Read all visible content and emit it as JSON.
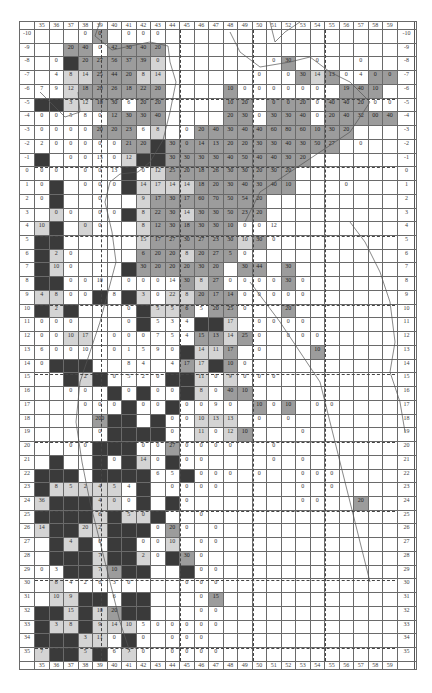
{
  "map": {
    "columns": [
      35,
      36,
      37,
      38,
      39,
      40,
      41,
      42,
      43,
      44,
      45,
      46,
      47,
      48,
      49,
      50,
      51,
      52,
      53,
      54,
      55,
      56,
      57,
      58,
      59
    ],
    "row_labels": [
      "-10",
      "-9",
      "-8",
      "-7",
      "-6",
      "-5",
      "-4",
      "-3",
      "-2",
      "-1",
      "0",
      "1",
      "2",
      "3",
      "4",
      "5",
      "6",
      "7",
      "8",
      "9",
      "10",
      "11",
      "12",
      "13",
      "14",
      "15",
      "16",
      "17",
      "18",
      "19",
      "20",
      "21",
      "22",
      "23",
      "24",
      "25",
      "26",
      "27",
      "28",
      "29",
      "30",
      "31",
      "32",
      "33",
      "34",
      "35"
    ],
    "dashed_columns_after": [
      39,
      44,
      49,
      54
    ],
    "dashed_rows_before": [
      "-5",
      "0",
      "5",
      "10",
      "15",
      "20",
      "25",
      "30",
      "35"
    ],
    "shade_legend": {
      "w": "#ffffff",
      "l": "#d4d4d4",
      "m": "#9c9c9c",
      "d": "#3a3a3a"
    },
    "rows": [
      [
        "w",
        "w",
        "w",
        "w:0",
        "m:0",
        "w",
        "w:0",
        "w:0",
        "w:0",
        "w",
        "w",
        "w",
        "w",
        "w",
        "w",
        "w",
        "w",
        "w",
        "w",
        "w",
        "w",
        "w",
        "w",
        "w",
        "w"
      ],
      [
        "w",
        "w",
        "m:20",
        "m:40",
        "w:0",
        "m:42",
        "m:30",
        "m:40",
        "m:20",
        "w",
        "w",
        "w",
        "w",
        "w",
        "w",
        "w",
        "w",
        "w",
        "w",
        "w",
        "w",
        "w",
        "w",
        "w",
        "w"
      ],
      [
        "w",
        "w:0",
        "d",
        "m:20",
        "m:27",
        "m:56",
        "m:37",
        "m:39",
        "l:0",
        "w",
        "w",
        "w",
        "w",
        "w",
        "w",
        "w",
        "w:0",
        "m:30",
        "w",
        "w:0",
        "w",
        "w",
        "w:0",
        "w",
        "w"
      ],
      [
        "w",
        "w:4",
        "l:8",
        "l:14",
        "m:25",
        "m:44",
        "m:20",
        "l:8",
        "l:14",
        "w",
        "w",
        "w",
        "w",
        "w",
        "w",
        "w:0",
        "w",
        "w:0",
        "m:30",
        "l:14",
        "m:13",
        "w:0",
        "w:4",
        "m:0",
        "m:0"
      ],
      [
        "w:7",
        "w:9",
        "l:12",
        "m:18",
        "m:20",
        "m:26",
        "m:18",
        "m:22",
        "m:20",
        "w",
        "w",
        "w",
        "w",
        "m:10",
        "w:0",
        "w:0",
        "w:0",
        "w:0",
        "w:0",
        "w:0",
        "w",
        "m:19",
        "m:40",
        "m:10",
        "w"
      ],
      [
        "d",
        "d",
        "l:3",
        "l:12",
        "m:10",
        "m:30",
        "w:6",
        "m:20",
        "m:20",
        "w",
        "w",
        "w",
        "w",
        "m:10",
        "m:20",
        "w",
        "m:0",
        "m:0",
        "m:20",
        "w:0",
        "m:40",
        "m:40",
        "m:20",
        "w:0",
        "w:0"
      ],
      [
        "w:0",
        "w:0",
        "w:5",
        "w:8",
        "w:0",
        "m:12",
        "m:30",
        "m:30",
        "m:40",
        "w",
        "w",
        "w",
        "w",
        "m:20",
        "m:30",
        "w:0",
        "m:30",
        "m:30",
        "m:40",
        "w:0",
        "m:20",
        "m:40",
        "m:32",
        "m:00",
        "m:40"
      ],
      [
        "w:0",
        "w:0",
        "w:0",
        "w:0",
        "m:20",
        "m:20",
        "m:23",
        "w:6",
        "l:8",
        "w",
        "w:0",
        "m:20",
        "m:40",
        "m:30",
        "m:40",
        "m:40",
        "m:60",
        "m:80",
        "m:60",
        "m:10",
        "m:30",
        "m:20",
        "w",
        "w",
        "w"
      ],
      [
        "w:2",
        "w:0",
        "w:0",
        "w:0",
        "w:0",
        "w:0",
        "m:21",
        "m:20",
        "d",
        "m:30",
        "m:0",
        "m:14",
        "m:13",
        "m:20",
        "m:20",
        "m:30",
        "m:30",
        "m:40",
        "m:30",
        "m:50",
        "m:27",
        "w",
        "w:0",
        "w",
        "w"
      ],
      [
        "d",
        "w",
        "w:0",
        "w:0",
        "w:15",
        "w:0",
        "l:12",
        "d",
        "d",
        "m:30",
        "m:30",
        "m:30",
        "m:30",
        "m:40",
        "m:50",
        "m:40",
        "m:40",
        "m:30",
        "m:20",
        "w",
        "w",
        "w",
        "w",
        "w",
        "w"
      ],
      [
        "w:0",
        "w:0",
        "w",
        "w:0",
        "w:0",
        "w:13",
        "d",
        "w:0",
        "l:12",
        "m:25",
        "m:20",
        "m:18",
        "m:26",
        "m:30",
        "m:30",
        "m:20",
        "m:30",
        "m:20",
        "w",
        "w",
        "w",
        "w",
        "w",
        "w",
        "w"
      ],
      [
        "w:0",
        "d",
        "w",
        "w:0",
        "w:0",
        "w:0",
        "d",
        "l:14",
        "l:17",
        "l:14",
        "l:14",
        "m:18",
        "m:20",
        "m:30",
        "m:40",
        "m:30",
        "m:40",
        "m:10",
        "w",
        "w",
        "w",
        "w:0",
        "w",
        "w",
        "w"
      ],
      [
        "w:0",
        "d",
        "w",
        "w",
        "w:0",
        "w",
        "w",
        "l:9",
        "m:17",
        "m:30",
        "m:17",
        "m:60",
        "m:70",
        "m:50",
        "m:54",
        "m:20",
        "w",
        "w",
        "w",
        "w",
        "w",
        "w",
        "w",
        "w",
        "w"
      ],
      [
        "w",
        "l:0",
        "w:0",
        "w",
        "w:0",
        "w:0",
        "d",
        "l:8",
        "m:22",
        "m:30",
        "l:14",
        "m:30",
        "m:30",
        "m:50",
        "m:23",
        "m:20",
        "w",
        "w",
        "w",
        "w",
        "w",
        "w",
        "w",
        "w",
        "w"
      ],
      [
        "l:10",
        "d",
        "w",
        "l:0",
        "w:0",
        "w",
        "w",
        "l:8",
        "m:12",
        "m:30",
        "m:18",
        "m:30",
        "m:30",
        "m:10",
        "w:0",
        "w:0",
        "w:12",
        "w",
        "w",
        "w",
        "w",
        "w",
        "w",
        "w",
        "w"
      ],
      [
        "d",
        "d",
        "w",
        "w",
        "w",
        "w",
        "w",
        "l:15",
        "m:17",
        "m:27",
        "m:30",
        "m:27",
        "m:23",
        "m:30",
        "l:10",
        "m:30",
        "w:0",
        "w",
        "w",
        "w",
        "w",
        "w",
        "w",
        "w",
        "w"
      ],
      [
        "d",
        "l:2",
        "w:0",
        "w",
        "w",
        "w",
        "w",
        "m:6",
        "m:20",
        "m:20",
        "l:8",
        "m:20",
        "m:27",
        "m:5",
        "w:0",
        "w",
        "w",
        "w",
        "w",
        "w",
        "w",
        "w",
        "w",
        "w",
        "w"
      ],
      [
        "d",
        "l:10",
        "w:0",
        "w",
        "w",
        "w",
        "d",
        "m:30",
        "m:20",
        "m:20",
        "m:20",
        "m:30",
        "m:20",
        "w",
        "m:30",
        "m:44",
        "w",
        "m:30",
        "w",
        "w",
        "w",
        "w",
        "w",
        "w",
        "w"
      ],
      [
        "d",
        "d",
        "w:0",
        "w:0",
        "w:10",
        "w",
        "w:0",
        "w:0",
        "w:0",
        "w:14",
        "m:30",
        "l:8",
        "m:27",
        "w:0",
        "w:0",
        "w:0",
        "w:0",
        "m:30",
        "w:0",
        "w",
        "w",
        "w",
        "w",
        "w",
        "w"
      ],
      [
        "l:4",
        "l:8",
        "w:0",
        "w:0",
        "d",
        "w:8",
        "d",
        "l:3",
        "w:0",
        "l:22",
        "l:8",
        "m:20",
        "m:17",
        "m:14",
        "w:0",
        "w:0",
        "w:0",
        "w:0",
        "w:0",
        "w",
        "w",
        "w",
        "w",
        "w",
        "w"
      ],
      [
        "d",
        "l:2",
        "d",
        "w",
        "w",
        "w",
        "w:0",
        "d",
        "l:5",
        "l:5",
        "m:6",
        "w:5",
        "m:20",
        "m:25",
        "w:0",
        "w",
        "w",
        "m:20",
        "w",
        "w",
        "w",
        "w",
        "w",
        "w",
        "w"
      ],
      [
        "w:0",
        "w:0",
        "w:0",
        "w",
        "w",
        "w",
        "w:0",
        "d",
        "w:5",
        "w:3",
        "w:4",
        "d",
        "d",
        "l:17",
        "w",
        "w:0",
        "w:0",
        "w:0",
        "w:0",
        "w",
        "w",
        "w",
        "w",
        "w",
        "w"
      ],
      [
        "w:0",
        "w:0",
        "l:10",
        "l:17",
        "w",
        "w:0",
        "w:0",
        "w:0",
        "w:7",
        "w:5",
        "w:4",
        "m:15",
        "m:13",
        "l:14",
        "m:25",
        "w:0",
        "w",
        "w:0",
        "w:0",
        "w:0",
        "w",
        "w",
        "w",
        "w",
        "w"
      ],
      [
        "w:6",
        "w:0",
        "w:0",
        "w:10",
        "w",
        "w:0",
        "w:1",
        "w:5",
        "w:9",
        "w:0",
        "d",
        "l:14",
        "l:11",
        "m:17",
        "w",
        "w:0",
        "w",
        "w",
        "w",
        "m:10",
        "w",
        "w",
        "w",
        "w",
        "w"
      ],
      [
        "w:0",
        "d",
        "d",
        "d",
        "w",
        "w",
        "w:8",
        "w:4",
        "w",
        "w:4",
        "m:17",
        "l:17",
        "d",
        "m:10",
        "w:0",
        "w",
        "w",
        "w",
        "w",
        "w",
        "w",
        "w",
        "w",
        "w",
        "w"
      ],
      [
        "w",
        "w",
        "d",
        "l:2",
        "d",
        "w:0",
        "w:5",
        "w:2",
        "w:0",
        "d",
        "d",
        "l:11",
        "w:0",
        "l:9",
        "w:0",
        "w:0",
        "w:0",
        "w",
        "w",
        "w",
        "w",
        "w",
        "w",
        "w",
        "w"
      ],
      [
        "w",
        "w",
        "w:0",
        "w:0",
        "w",
        "d",
        "w:0",
        "d",
        "w:0",
        "w:0",
        "d",
        "l:8",
        "w:0",
        "m:40",
        "m:10",
        "w",
        "w",
        "w",
        "w",
        "w",
        "w",
        "w",
        "w",
        "w",
        "w"
      ],
      [
        "w",
        "w",
        "w",
        "w:0",
        "w:0",
        "w:0",
        "d",
        "w:0",
        "w:0",
        "d",
        "w:0",
        "w:0",
        "w:9",
        "w:0",
        "w",
        "m:10",
        "w:0",
        "m:10",
        "w",
        "w:0",
        "w:0",
        "w",
        "w",
        "w",
        "w"
      ],
      [
        "w",
        "w",
        "w",
        "w",
        "m:200",
        "d",
        "d",
        "w",
        "d",
        "w:0",
        "w:0",
        "l:10",
        "l:13",
        "l:13",
        "w",
        "w:0",
        "w",
        "w:0",
        "w",
        "w",
        "w",
        "w",
        "w",
        "w",
        "w"
      ],
      [
        "w",
        "w",
        "w",
        "w",
        "w:0",
        "d",
        "d",
        "d",
        "d",
        "w:0",
        "w",
        "l:11",
        "w:0",
        "l:12",
        "m:10",
        "w",
        "w",
        "w",
        "w:0",
        "w",
        "w",
        "w",
        "w",
        "w",
        "w"
      ],
      [
        "w",
        "w",
        "w:0",
        "w:0",
        "d",
        "d",
        "d",
        "w:0",
        "w:0",
        "m:27",
        "w:0",
        "w:0",
        "w:0",
        "w:0",
        "w",
        "w",
        "w:0",
        "w",
        "w",
        "w",
        "w",
        "w",
        "w",
        "w",
        "w"
      ],
      [
        "w",
        "d",
        "w",
        "w",
        "d",
        "w:0",
        "d",
        "l:14",
        "w:0",
        "d",
        "w:0",
        "w:0",
        "w",
        "w",
        "w",
        "w",
        "w:0",
        "w",
        "w:0",
        "w",
        "w",
        "w",
        "w",
        "w",
        "w"
      ],
      [
        "d",
        "d",
        "d",
        "w",
        "d",
        "d",
        "d",
        "d",
        "w:6",
        "w:5",
        "d",
        "w:0",
        "w:0",
        "w:0",
        "w",
        "w:0",
        "w",
        "w",
        "w:0",
        "w:0",
        "w:0",
        "w",
        "w",
        "w",
        "w"
      ],
      [
        "d",
        "l:8",
        "l:5",
        "l:2",
        "l:4",
        "l:5",
        "w:4",
        "d",
        "w",
        "w:0",
        "w:0",
        "w:0",
        "w:0",
        "w",
        "w",
        "w",
        "w",
        "w",
        "w:0",
        "w",
        "w:0",
        "w",
        "w",
        "w",
        "w"
      ],
      [
        "l:36",
        "d",
        "d",
        "d",
        "l:4",
        "l:0",
        "w:0",
        "d",
        "w",
        "d",
        "w:0",
        "w",
        "w",
        "w",
        "w",
        "w",
        "w",
        "w",
        "w:0",
        "w:0",
        "w",
        "w",
        "m:20",
        "w",
        "w"
      ],
      [
        "d",
        "d",
        "d",
        "d",
        "l:6",
        "d",
        "l:5",
        "l:0",
        "d",
        "w",
        "w",
        "w:0",
        "w",
        "w",
        "w",
        "w",
        "w",
        "w",
        "w",
        "w",
        "w",
        "w",
        "w",
        "w",
        "w"
      ],
      [
        "l:14",
        "d",
        "d",
        "l:20",
        "l:2",
        "d",
        "d",
        "d",
        "w:0",
        "m:20",
        "w:0",
        "w",
        "w:0",
        "w",
        "w",
        "w",
        "w",
        "w",
        "w",
        "w",
        "w",
        "w",
        "w",
        "w",
        "w"
      ],
      [
        "w",
        "d",
        "l:4",
        "d",
        "w:0",
        "d",
        "d",
        "w:0",
        "w:0",
        "l:10",
        "w",
        "w:0",
        "w:0",
        "w",
        "w",
        "w",
        "w",
        "w",
        "w",
        "w",
        "w",
        "w",
        "w",
        "w",
        "w"
      ],
      [
        "w",
        "d",
        "d",
        "d",
        "l:7",
        "d",
        "d",
        "l:2",
        "w:0",
        "d",
        "m:30",
        "w:0",
        "w",
        "w",
        "w",
        "w",
        "w",
        "w",
        "w",
        "w",
        "w",
        "w",
        "w",
        "w",
        "w"
      ],
      [
        "w:0",
        "w:3",
        "d",
        "d",
        "l:7",
        "m:10",
        "d",
        "d",
        "w",
        "w",
        "d",
        "w:0",
        "w:0",
        "w",
        "w",
        "w",
        "w",
        "w",
        "w",
        "w",
        "w",
        "w",
        "w",
        "w",
        "w"
      ],
      [
        "w",
        "l:8",
        "w:4",
        "w:2",
        "w:6",
        "w:3",
        "w:0",
        "w",
        "w",
        "w",
        "w:0",
        "w:0",
        "w:0",
        "w",
        "w",
        "w",
        "w",
        "w",
        "w",
        "w",
        "w",
        "w",
        "w",
        "w",
        "w"
      ],
      [
        "w",
        "l:10",
        "l:9",
        "d",
        "d",
        "w:6",
        "d",
        "d",
        "w",
        "w",
        "w",
        "w:0",
        "m:15",
        "w",
        "w",
        "w",
        "w",
        "w",
        "w",
        "w",
        "w",
        "w",
        "w",
        "w",
        "w"
      ],
      [
        "d",
        "d",
        "l:15",
        "d",
        "l:10",
        "m:20",
        "d",
        "d",
        "w",
        "w",
        "w",
        "w:0",
        "w:0",
        "w",
        "w",
        "w",
        "w",
        "w",
        "w",
        "w",
        "w",
        "w",
        "w",
        "w",
        "w"
      ],
      [
        "d",
        "l:3",
        "l:8",
        "d",
        "l:9",
        "l:14",
        "l:10",
        "w:5",
        "w:0",
        "w:0",
        "w:0",
        "w:0",
        "w:0",
        "w",
        "w",
        "w",
        "w",
        "w",
        "w",
        "w",
        "w",
        "w",
        "w",
        "w",
        "w"
      ],
      [
        "d",
        "d",
        "d",
        "l:3",
        "l:11",
        "w:0",
        "d",
        "w:0",
        "w",
        "w:0",
        "w:0",
        "w:0",
        "w",
        "w",
        "w",
        "w",
        "w",
        "w",
        "w",
        "w",
        "w",
        "w",
        "w",
        "w",
        "w"
      ],
      [
        "l:7",
        "d",
        "d",
        "l:5",
        "d",
        "w:6",
        "l:7",
        "w:0",
        "w",
        "w:0",
        "w:0",
        "w:0",
        "w:0",
        "w",
        "w",
        "w",
        "w",
        "w",
        "w",
        "w",
        "w",
        "w",
        "w",
        "w",
        "w"
      ]
    ]
  }
}
